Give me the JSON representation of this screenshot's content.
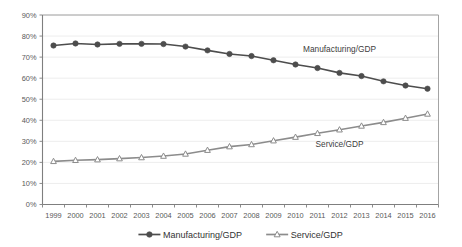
{
  "chart_data": {
    "type": "line",
    "title": "",
    "subtitle": "",
    "xlabel": "",
    "ylabel": "",
    "x": [
      1999,
      2000,
      2001,
      2002,
      2003,
      2004,
      2005,
      2006,
      2007,
      2008,
      2009,
      2010,
      2011,
      2012,
      2013,
      2014,
      2015,
      2016
    ],
    "categories": [
      "1999",
      "2000",
      "2001",
      "2002",
      "2003",
      "2004",
      "2005",
      "2006",
      "2007",
      "2008",
      "2009",
      "2010",
      "2011",
      "2012",
      "2013",
      "2014",
      "2015",
      "2016"
    ],
    "series": [
      {
        "name": "Manufacturing/GDP",
        "marker": "filled-circle",
        "color": "#4d4d4d",
        "values": [
          75.5,
          76.5,
          76.0,
          76.3,
          76.3,
          76.2,
          75.0,
          73.2,
          71.5,
          70.5,
          68.5,
          66.5,
          64.8,
          62.5,
          61.0,
          58.5,
          56.5,
          55.0
        ]
      },
      {
        "name": "Service/GDP",
        "marker": "open-triangle",
        "color": "#8c8c8c",
        "values": [
          20.5,
          21.0,
          21.3,
          21.8,
          22.3,
          23.0,
          24.0,
          25.8,
          27.5,
          28.5,
          30.3,
          32.0,
          33.8,
          35.5,
          37.3,
          39.0,
          41.0,
          43.0
        ]
      }
    ],
    "ylim": [
      0,
      90
    ],
    "ytick_labels": [
      "0%",
      "10%",
      "20%",
      "30%",
      "40%",
      "50%",
      "60%",
      "70%",
      "80%",
      "90%"
    ],
    "ytick_values": [
      0,
      10,
      20,
      30,
      40,
      50,
      60,
      70,
      80,
      90
    ],
    "grid": true,
    "legend_position": "bottom",
    "annotations": [
      {
        "text": "Manufacturing/GDP",
        "x": 2012,
        "y": 72.5
      },
      {
        "text": "Service/GDP",
        "x": 2012,
        "y": 27.5
      }
    ],
    "legend": [
      {
        "label": "Manufacturing/GDP",
        "marker": "filled-circle",
        "color": "#4d4d4d"
      },
      {
        "label": "Service/GDP",
        "marker": "open-triangle",
        "color": "#8c8c8c"
      }
    ]
  }
}
